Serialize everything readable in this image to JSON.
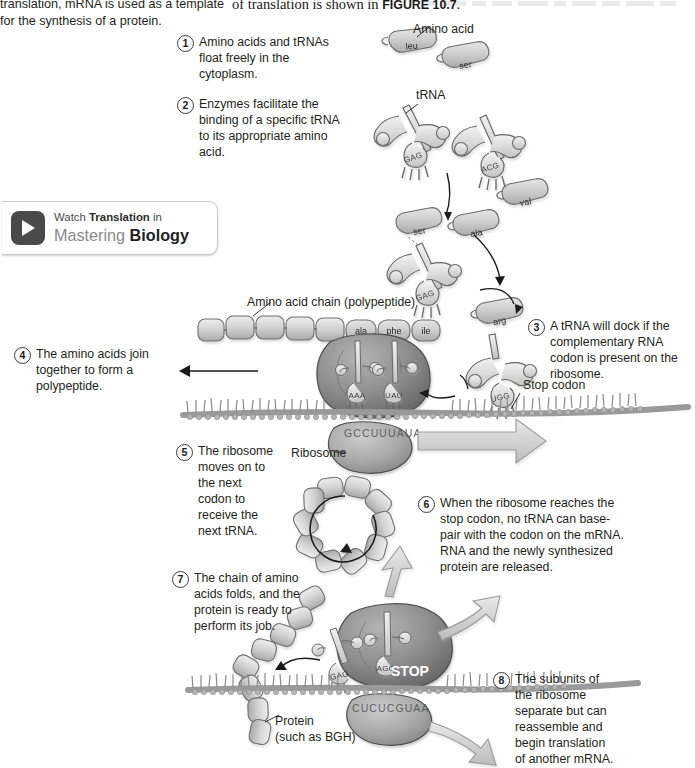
{
  "figure": {
    "intro_left": "translation, mRNA is used as a template for the synthesis of a protein.",
    "intro_right_prefix": "of translation is shown in ",
    "figure_reference": "FIGURE 10.7",
    "intro_right_suffix": "."
  },
  "promo": {
    "line1_pre": "Watch ",
    "line1_bold": "Translation",
    "line1_post": " in",
    "line2_light": "Mastering ",
    "line2_bold": "Biology",
    "icon": "play-icon"
  },
  "steps": [
    {
      "number": "1",
      "text": "Amino acids and tRNAs float freely in the cytoplasm."
    },
    {
      "number": "2",
      "text": "Enzymes facilitate the binding of a specific tRNA to its appropriate amino acid."
    },
    {
      "number": "3",
      "text": "A tRNA will dock if the complementary RNA codon is present on the ribosome."
    },
    {
      "number": "4",
      "text": "The amino acids join together to form a polypeptide."
    },
    {
      "number": "5",
      "text": "The ribosome moves on to the next codon to receive the next tRNA."
    },
    {
      "number": "6",
      "text": "When the ribosome reaches the stop codon, no tRNA can base-pair with the codon on the mRNA. RNA and the newly synthesized protein are released."
    },
    {
      "number": "7",
      "text": "The chain of amino acids folds, and the protein is ready to perform its job."
    },
    {
      "number": "8",
      "text": "The subunits of the ribosome separate but can reassemble and begin translation of another mRNA."
    }
  ],
  "labels": {
    "amino_acid": "Amino acid",
    "trna": "tRNA",
    "amino_acid_chain": "Amino acid chain (polypeptide)",
    "stop_codon": "Stop codon",
    "ribosome": "Ribosome",
    "protein_line1": "Protein",
    "protein_line2": "(such as BGH)"
  },
  "molecules": {
    "free_amino_acids": [
      "leu",
      "ser",
      "val",
      "ala",
      "arg"
    ],
    "charged_amino_acids": [
      "ser",
      "ala",
      "arg"
    ],
    "polypeptide_residues": [
      "ala",
      "phe",
      "ile"
    ],
    "free_trna_anticodons": [
      "GAG",
      "ACG"
    ],
    "charged_trna_anticodons": [
      "GAG",
      "UCG"
    ],
    "ribosome_anticodons": [
      "AAA",
      "UAU"
    ],
    "incoming_trna_anticodon": "UGG",
    "lower_trna_anticodons": [
      "GAG",
      "AGG"
    ]
  },
  "sequences": {
    "mrna_upper": "GCCUUUAUA",
    "mrna_lower": "CUCUCGUAA",
    "stop_label": "STOP"
  },
  "colors": {
    "ink": "#231f20",
    "ribosome_dark": "#8b8b8b",
    "ribosome_light": "#b9b9b9",
    "amino_acid_fill": "#c9c9c9",
    "mrna_strand": "#9a9a9a",
    "arrow_gray": "#cfcfcf",
    "promo_icon": "#4a4a4a"
  }
}
